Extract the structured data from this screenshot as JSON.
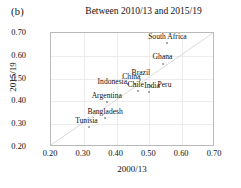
{
  "figure": {
    "panel_label": "(b)",
    "title": "Between 2010/13 and 2015/19"
  },
  "chart_data": {
    "type": "scatter",
    "title": "Between 2010/13 and 2015/19",
    "panel": "(b)",
    "xlabel": "2000/13",
    "ylabel": "2015/19",
    "xlim": [
      0.2,
      0.7
    ],
    "ylim": [
      0.2,
      0.7
    ],
    "xticks": [
      "0.20",
      "0.30",
      "0.40",
      "0.50",
      "0.60",
      "0.70"
    ],
    "yticks": [
      "0.20",
      "0.30",
      "0.40",
      "0.50",
      "0.60",
      "0.70"
    ],
    "xtick_values": [
      0.2,
      0.3,
      0.4,
      0.5,
      0.6,
      0.7
    ],
    "ytick_values": [
      0.2,
      0.3,
      0.4,
      0.5,
      0.6,
      0.7
    ],
    "grid": true,
    "legend": "none",
    "reference_line": {
      "name": "identity-line",
      "type": "diagonal",
      "equation": "y = x",
      "from": [
        0.2,
        0.2
      ],
      "to": [
        0.7,
        0.7
      ],
      "color": "#d0d0d0"
    },
    "marker_color": "#8e8e8e",
    "points": [
      {
        "label": "South Africa",
        "x": 0.555,
        "y": 0.655,
        "label_dx": 0,
        "label_dy": -0.028
      },
      {
        "label": "Ghana",
        "x": 0.54,
        "y": 0.565,
        "label_dx": 0,
        "label_dy": -0.028
      },
      {
        "label": "Brazil",
        "x": 0.47,
        "y": 0.495,
        "label_dx": 0.004,
        "label_dy": -0.028
      },
      {
        "label": "China",
        "x": 0.455,
        "y": 0.478,
        "label_dx": -0.01,
        "label_dy": -0.028
      },
      {
        "label": "Indonesia",
        "x": 0.435,
        "y": 0.475,
        "label_dx": -0.048,
        "label_dy": -0.012
      },
      {
        "label": "Chile",
        "x": 0.466,
        "y": 0.447,
        "label_dx": -0.008,
        "label_dy": -0.024
      },
      {
        "label": "Peru",
        "x": 0.506,
        "y": 0.466,
        "label_dx": 0.04,
        "label_dy": -0.008
      },
      {
        "label": "India",
        "x": 0.5,
        "y": 0.44,
        "label_dx": 0.008,
        "label_dy": -0.026
      },
      {
        "label": "Argentina",
        "x": 0.37,
        "y": 0.396,
        "label_dx": 0,
        "label_dy": -0.028
      },
      {
        "label": "Bangladesh",
        "x": 0.365,
        "y": 0.326,
        "label_dx": 0,
        "label_dy": -0.028
      },
      {
        "label": "Tunisia",
        "x": 0.316,
        "y": 0.286,
        "label_dx": -0.008,
        "label_dy": -0.028
      }
    ]
  }
}
